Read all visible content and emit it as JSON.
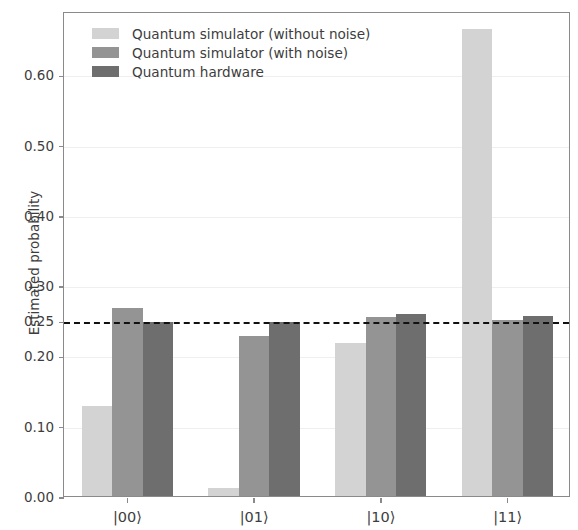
{
  "chart_data": {
    "type": "bar",
    "title": "",
    "subtitle": "",
    "xlabel": "",
    "ylabel": "Estimated probability",
    "categories": [
      "|00⟩",
      "|01⟩",
      "|10⟩",
      "|11⟩"
    ],
    "series": [
      {
        "name": "Quantum simulator (without noise)",
        "color": "#d3d3d3",
        "values": [
          0.128,
          0.012,
          0.218,
          0.664
        ]
      },
      {
        "name": "Quantum simulator (with noise)",
        "color": "#949494",
        "values": [
          0.268,
          0.228,
          0.254,
          0.25
        ]
      },
      {
        "name": "Quantum hardware",
        "color": "#6e6e6e",
        "values": [
          0.248,
          0.248,
          0.259,
          0.256
        ]
      }
    ],
    "ylim": [
      0.0,
      0.69
    ],
    "yticks": [
      0.0,
      0.1,
      0.2,
      0.25,
      0.3,
      0.4,
      0.5,
      0.6
    ],
    "ytick_labels": [
      "0.00",
      "0.10",
      "0.20",
      "0.25",
      "0.30",
      "0.40",
      "0.50",
      "0.60"
    ],
    "gridlines": [
      0.1,
      0.2,
      0.3,
      0.4,
      0.5,
      0.6
    ],
    "grid": true,
    "annotations": [
      {
        "name": "uniform-probability-threshold",
        "type": "hline",
        "value": 0.25,
        "style": "dashed",
        "color": "#111111"
      }
    ],
    "legend_position": "upper left",
    "legend_entries": [
      "Quantum simulator (without noise)",
      "Quantum simulator (with noise)",
      "Quantum hardware"
    ]
  }
}
